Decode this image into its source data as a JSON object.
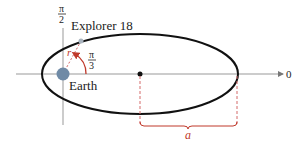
{
  "diagram": {
    "satellite_label": "Explorer 18",
    "body_label": "Earth",
    "axis_top_label": {
      "num": "π",
      "den": "2"
    },
    "axis_right_label": "0",
    "angle_label": {
      "num": "π",
      "den": "3"
    },
    "radius_label": "r",
    "semi_major_label": "a",
    "colors": {
      "orbit": "#111111",
      "axis": "#888888",
      "earth": "#6f8aa6",
      "accent": "#c0392b"
    }
  }
}
